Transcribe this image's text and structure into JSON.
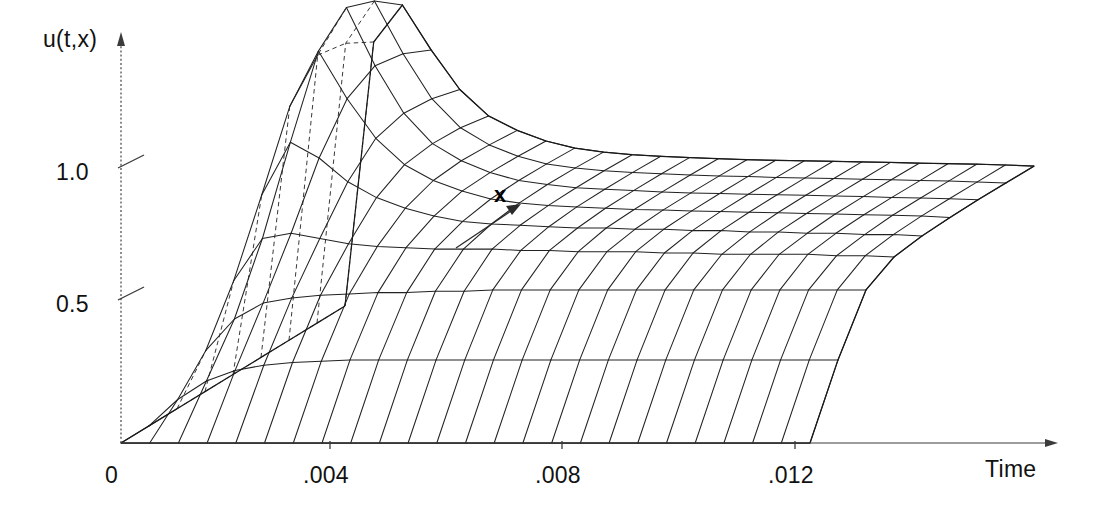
{
  "figure": {
    "type": "surface-wireframe-3d",
    "background_color": "#ffffff",
    "line_color": "#222222",
    "axis_color": "#3b3b3b"
  },
  "labels": {
    "y_axis": "u(t,x)",
    "x_axis": "Time",
    "depth_axis": "x"
  },
  "chart_data": {
    "type": "line",
    "title": "",
    "subtitle": "",
    "xlabel": "Time",
    "ylabel": "u(t,x)",
    "zlabel": "x",
    "grid": false,
    "legend": "none",
    "projection": "3d-wireframe-surface",
    "xlim": [
      0,
      0.0155
    ],
    "ylim": [
      0,
      1.35
    ],
    "xticks": [
      0,
      0.004,
      0.008,
      0.012
    ],
    "xtick_labels": [
      "0",
      ".004",
      ".008",
      ".012"
    ],
    "yticks": [
      0.5,
      1.0
    ],
    "ytick_labels": [
      "0.5",
      "1.0"
    ],
    "annotations": [
      {
        "text": "x",
        "points_to": "space-direction-gridlines"
      }
    ],
    "x": [
      0.0,
      0.00055,
      0.0011,
      0.00165,
      0.0022,
      0.00275,
      0.0033,
      0.00385,
      0.0044,
      0.00495,
      0.0055,
      0.00605,
      0.0066,
      0.00715,
      0.0077,
      0.00825,
      0.0088,
      0.00935,
      0.0099,
      0.01045,
      0.011,
      0.01155,
      0.0121,
      0.01265,
      0.0132
    ],
    "series": [
      {
        "name": "x = 0.0 (front edge)",
        "values": [
          0.0,
          0.0,
          0.0,
          0.0,
          0.0,
          0.0,
          0.0,
          0.0,
          0.0,
          0.0,
          0.0,
          0.0,
          0.0,
          0.0,
          0.0,
          0.0,
          0.0,
          0.0,
          0.0,
          0.0,
          0.0,
          0.0,
          0.0,
          0.0,
          0.0
        ]
      },
      {
        "name": "x = 0.125",
        "values": [
          0.0,
          0.1,
          0.17,
          0.21,
          0.23,
          0.24,
          0.245,
          0.25,
          0.25,
          0.25,
          0.25,
          0.25,
          0.25,
          0.25,
          0.25,
          0.25,
          0.25,
          0.25,
          0.25,
          0.25,
          0.25,
          0.25,
          0.25,
          0.25,
          0.25
        ]
      },
      {
        "name": "x = 0.25",
        "values": [
          0.0,
          0.22,
          0.34,
          0.4,
          0.42,
          0.43,
          0.435,
          0.44,
          0.44,
          0.445,
          0.445,
          0.45,
          0.45,
          0.45,
          0.45,
          0.45,
          0.45,
          0.45,
          0.45,
          0.45,
          0.45,
          0.45,
          0.45,
          0.45,
          0.45
        ]
      },
      {
        "name": "x = 0.375",
        "values": [
          0.0,
          0.42,
          0.58,
          0.6,
          0.58,
          0.56,
          0.55,
          0.545,
          0.54,
          0.54,
          0.54,
          0.535,
          0.535,
          0.53,
          0.53,
          0.53,
          0.525,
          0.525,
          0.52,
          0.52,
          0.52,
          0.52,
          0.515,
          0.515,
          0.51
        ]
      },
      {
        "name": "x = 0.5",
        "values": [
          0.0,
          0.68,
          0.88,
          0.82,
          0.73,
          0.67,
          0.63,
          0.6,
          0.58,
          0.57,
          0.565,
          0.56,
          0.555,
          0.555,
          0.55,
          0.55,
          0.545,
          0.545,
          0.54,
          0.54,
          0.535,
          0.535,
          0.53,
          0.53,
          0.525
        ]
      },
      {
        "name": "x = 0.625",
        "values": [
          0.0,
          0.95,
          1.16,
          0.98,
          0.83,
          0.73,
          0.67,
          0.63,
          0.6,
          0.585,
          0.575,
          0.57,
          0.565,
          0.56,
          0.558,
          0.555,
          0.552,
          0.55,
          0.548,
          0.545,
          0.543,
          0.54,
          0.538,
          0.535,
          0.53
        ]
      },
      {
        "name": "x = 0.75",
        "values": [
          0.0,
          1.08,
          1.26,
          1.04,
          0.86,
          0.745,
          0.68,
          0.635,
          0.605,
          0.59,
          0.578,
          0.572,
          0.567,
          0.562,
          0.558,
          0.556,
          0.553,
          0.551,
          0.549,
          0.546,
          0.544,
          0.541,
          0.539,
          0.536,
          0.532
        ]
      },
      {
        "name": "x = 0.875",
        "values": [
          0.0,
          1.06,
          1.22,
          1.02,
          0.85,
          0.74,
          0.675,
          0.632,
          0.603,
          0.588,
          0.577,
          0.571,
          0.566,
          0.561,
          0.557,
          0.555,
          0.552,
          0.55,
          0.548,
          0.545,
          0.543,
          0.54,
          0.538,
          0.535,
          0.531
        ]
      },
      {
        "name": "x = 1.0 (back edge)",
        "values": [
          0.0,
          1.0,
          1.14,
          0.97,
          0.82,
          0.72,
          0.665,
          0.625,
          0.598,
          0.583,
          0.573,
          0.567,
          0.562,
          0.558,
          0.554,
          0.552,
          0.55,
          0.548,
          0.546,
          0.544,
          0.541,
          0.539,
          0.537,
          0.534,
          0.53
        ]
      }
    ]
  },
  "projection": {
    "origin_px": [
      121,
      443
    ],
    "time_axis_end_px": [
      1058,
      443
    ],
    "value_axis_top_px": [
      121,
      36
    ],
    "depth_vector_px": [
      224,
      -137
    ],
    "px_per_time_unit": 52200,
    "px_per_value_unit": 264
  }
}
